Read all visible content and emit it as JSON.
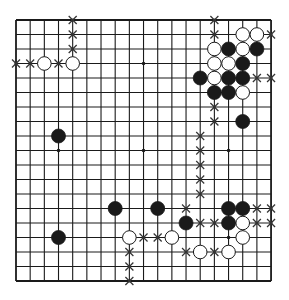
{
  "board": {
    "size": 19,
    "origin": {
      "x": 16,
      "y": 20
    },
    "spacing": {
      "x": 14.17,
      "y": 14.5
    },
    "colors": {
      "background": "#ffffff",
      "line": "#1a1a1a",
      "black_stone": "#1a1a1a",
      "white_stone": "#ffffff",
      "marker": "#333333"
    },
    "star_points": [
      [
        3,
        3
      ],
      [
        9,
        3
      ],
      [
        15,
        3
      ],
      [
        3,
        9
      ],
      [
        9,
        9
      ],
      [
        15,
        9
      ],
      [
        3,
        15
      ],
      [
        9,
        15
      ],
      [
        15,
        15
      ]
    ],
    "black_stones": [
      [
        15,
        2
      ],
      [
        17,
        2
      ],
      [
        16,
        3
      ],
      [
        13,
        4
      ],
      [
        15,
        4
      ],
      [
        16,
        4
      ],
      [
        14,
        5
      ],
      [
        15,
        5
      ],
      [
        16,
        7
      ],
      [
        3,
        8
      ],
      [
        7,
        13
      ],
      [
        10,
        13
      ],
      [
        15,
        13
      ],
      [
        16,
        13
      ],
      [
        12,
        14
      ],
      [
        15,
        14
      ],
      [
        3,
        15
      ]
    ],
    "white_stones": [
      [
        2,
        3
      ],
      [
        4,
        3
      ],
      [
        16,
        1
      ],
      [
        17,
        1
      ],
      [
        14,
        2
      ],
      [
        16,
        2
      ],
      [
        14,
        3
      ],
      [
        15,
        3
      ],
      [
        14,
        4
      ],
      [
        16,
        5
      ],
      [
        16,
        14
      ],
      [
        8,
        15
      ],
      [
        11,
        15
      ],
      [
        16,
        15
      ],
      [
        13,
        16
      ],
      [
        15,
        16
      ]
    ],
    "x_marks": [
      [
        4,
        0
      ],
      [
        4,
        1
      ],
      [
        4,
        2
      ],
      [
        0,
        3
      ],
      [
        1,
        3
      ],
      [
        3,
        3
      ],
      [
        14,
        0
      ],
      [
        14,
        1
      ],
      [
        18,
        1
      ],
      [
        17,
        4
      ],
      [
        18,
        4
      ],
      [
        14,
        6
      ],
      [
        14,
        7
      ],
      [
        13,
        8
      ],
      [
        13,
        9
      ],
      [
        13,
        10
      ],
      [
        13,
        11
      ],
      [
        13,
        12
      ],
      [
        12,
        13
      ],
      [
        17,
        13
      ],
      [
        18,
        13
      ],
      [
        13,
        14
      ],
      [
        14,
        14
      ],
      [
        17,
        14
      ],
      [
        18,
        14
      ],
      [
        9,
        15
      ],
      [
        10,
        15
      ],
      [
        12,
        16
      ],
      [
        14,
        16
      ],
      [
        8,
        16
      ],
      [
        8,
        17
      ],
      [
        8,
        18
      ]
    ]
  }
}
